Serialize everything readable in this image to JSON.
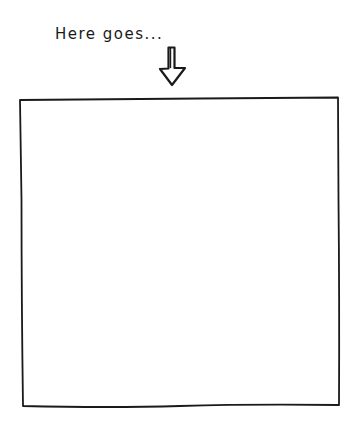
{
  "caption": {
    "text": "Here goes..."
  },
  "arrow": {
    "icon": "down-arrow-icon",
    "direction": "down"
  },
  "frame": {
    "content": ""
  },
  "colors": {
    "ink": "#1a1a1a",
    "background": "#ffffff"
  }
}
